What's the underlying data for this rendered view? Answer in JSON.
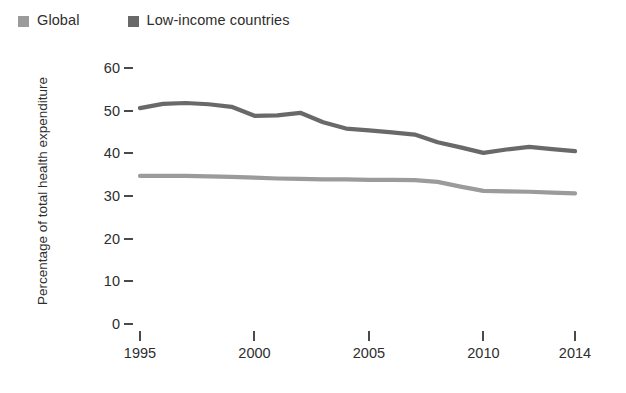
{
  "chart_data": {
    "type": "line",
    "title": "",
    "subtitle": "",
    "xlabel": "",
    "ylabel": "Percentage of total health expenditure",
    "xlim": [
      1995,
      2014
    ],
    "ylim": [
      0,
      60
    ],
    "grid": false,
    "legend_position": "top-left",
    "y_ticks": [
      0,
      10,
      20,
      30,
      40,
      50,
      60
    ],
    "y_tick_labels": [
      "0",
      "10",
      "20",
      "30",
      "40",
      "50",
      "60"
    ],
    "x_ticks": [
      1995,
      2000,
      2005,
      2010,
      2014
    ],
    "x_tick_labels": [
      "1995",
      "2000",
      "2005",
      "2010",
      "2014"
    ],
    "x": [
      1995,
      1996,
      1997,
      1998,
      1999,
      2000,
      2001,
      2002,
      2003,
      2004,
      2005,
      2006,
      2007,
      2008,
      2009,
      2010,
      2011,
      2012,
      2013,
      2014
    ],
    "series": [
      {
        "name": "Global",
        "color": "#9b9b9b",
        "values": [
          34.7,
          34.7,
          34.7,
          34.6,
          34.5,
          34.3,
          34.1,
          34.0,
          33.9,
          33.9,
          33.8,
          33.8,
          33.7,
          33.3,
          32.2,
          31.2,
          31.1,
          31.0,
          30.8,
          30.6
        ]
      },
      {
        "name": "Low-income countries",
        "color": "#696969",
        "values": [
          50.6,
          51.6,
          51.8,
          51.5,
          50.9,
          48.8,
          48.9,
          49.5,
          47.3,
          45.8,
          45.4,
          44.9,
          44.4,
          42.6,
          41.4,
          40.1,
          40.9,
          41.5,
          41.0,
          40.5
        ]
      }
    ]
  },
  "legend": {
    "entries": [
      {
        "label": "Global",
        "color": "#9b9b9b"
      },
      {
        "label": "Low-income countries",
        "color": "#696969"
      }
    ]
  },
  "axes": {
    "y_title": "Percentage of total health expenditure"
  }
}
